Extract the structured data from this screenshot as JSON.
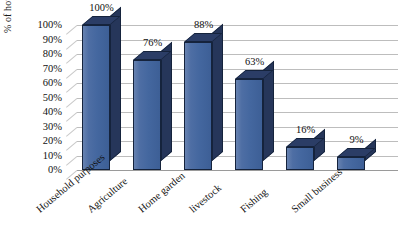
{
  "chart_data": {
    "type": "bar",
    "title": "",
    "xlabel": "",
    "ylabel": "% of households",
    "categories": [
      "Household purposes",
      "Agriculture",
      "Home garden",
      "livestock",
      "Fishing",
      "Small business"
    ],
    "values": [
      100,
      76,
      88,
      63,
      16,
      9
    ],
    "data_labels": [
      "100%",
      "76%",
      "88%",
      "63%",
      "16%",
      "9%"
    ],
    "ylim": [
      0,
      100
    ],
    "ytick_labels": [
      "100%",
      "90%",
      "80%",
      "70%",
      "60%",
      "50%",
      "40%",
      "30%",
      "20%",
      "10%",
      "0%"
    ],
    "ytick_values": [
      100,
      90,
      80,
      70,
      60,
      50,
      40,
      30,
      20,
      10,
      0
    ],
    "grid": true,
    "legend": "none",
    "style": "3d-column",
    "colors": {
      "bar_front": "#44679f",
      "bar_side": "#26365a",
      "bar_top": "#2b3d66",
      "bar_outline": "#15233c",
      "gridline": "#bdbdbd",
      "text": "#111111",
      "background": "#ffffff"
    }
  }
}
